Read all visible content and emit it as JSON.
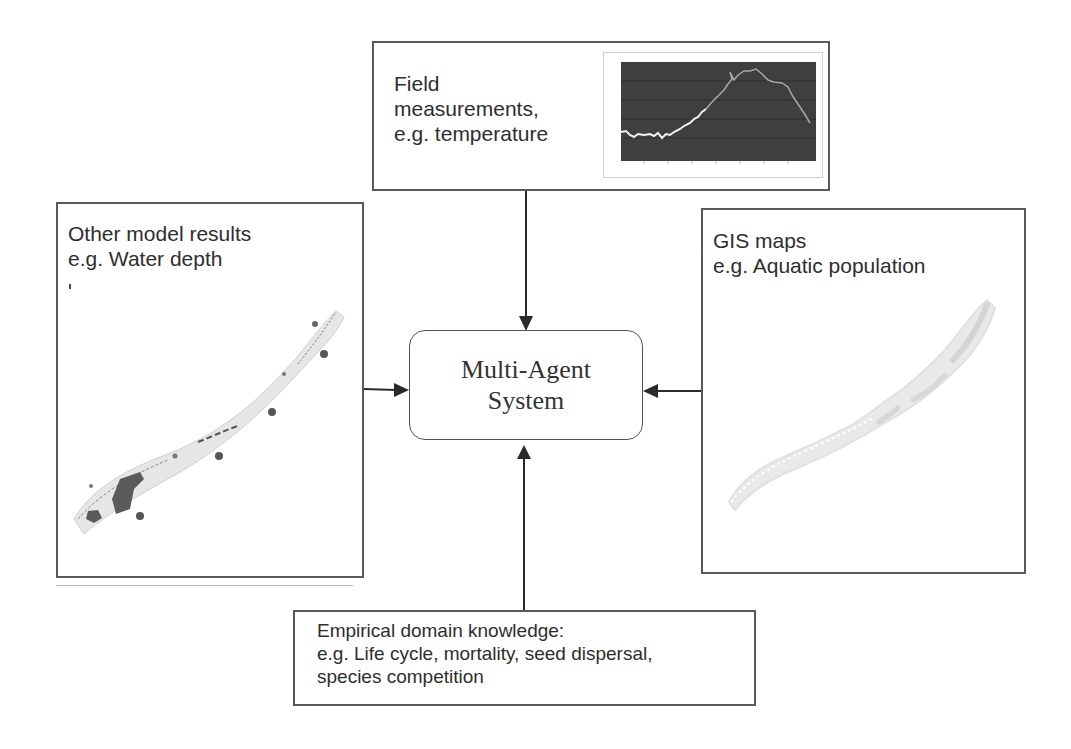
{
  "diagram": {
    "center": {
      "line1": "Multi-Agent",
      "line2": "System"
    },
    "inputs": {
      "top": {
        "line1": "Field",
        "line2": "measurements,",
        "line3": "e.g. temperature",
        "thumbnail": "temperature-line-chart"
      },
      "left": {
        "line1": "Other model results",
        "line2": "e.g. Water depth",
        "thumbnail": "water-depth-lake-map"
      },
      "right": {
        "line1": "GIS maps",
        "line2": "e.g. Aquatic population",
        "thumbnail": "aquatic-population-lake-map"
      },
      "bottom": {
        "line1": "Empirical domain knowledge:",
        "line2": "e.g. Life cycle, mortality, seed dispersal,",
        "line3": "species competition"
      }
    },
    "edges": [
      {
        "from": "top",
        "to": "center"
      },
      {
        "from": "left",
        "to": "center"
      },
      {
        "from": "right",
        "to": "center"
      },
      {
        "from": "bottom",
        "to": "center"
      }
    ],
    "colors": {
      "border": "#5a5a5a",
      "chart_bg": "#3f3f3f",
      "chart_line_light": "#f2f2f2",
      "chart_line_dim": "#9a9a9a",
      "map_fill": "#e6e6e6",
      "map_dark": "#555555"
    }
  }
}
